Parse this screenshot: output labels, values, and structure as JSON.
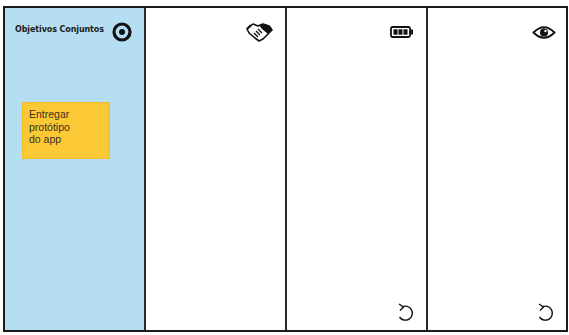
{
  "board": {
    "columns": [
      {
        "title": "Objetivos Conjuntos",
        "icon": "target-icon",
        "background": "#b6def2",
        "stickies": [
          {
            "text": "Entregar\nprotótipo\ndo app",
            "color": "#fbc935"
          }
        ]
      },
      {
        "title": "",
        "icon": "handshake-icon",
        "stickies": []
      },
      {
        "title": "",
        "icon": "battery-icon",
        "footer_icon": "undo-icon",
        "stickies": []
      },
      {
        "title": "",
        "icon": "eye-icon",
        "footer_icon": "undo-icon",
        "stickies": []
      }
    ]
  }
}
